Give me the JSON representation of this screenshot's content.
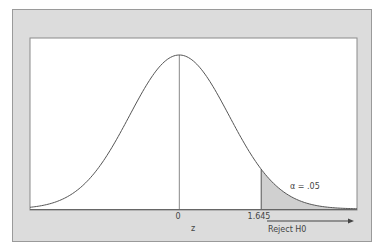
{
  "chart_data": {
    "type": "area",
    "title": "",
    "xlabel": "z",
    "ylabel": "",
    "distribution": "standard normal",
    "xlim": [
      -3.0,
      3.57
    ],
    "x_ticks": [
      {
        "value": 0,
        "label": "0"
      },
      {
        "value": 1.645,
        "label": "1.645"
      }
    ],
    "critical_value": 1.645,
    "shaded_region": {
      "from": 1.645,
      "to": 3.57,
      "label": "α = .05",
      "area": 0.05
    },
    "annotations": [
      {
        "text": "α = .05",
        "x": 2.3,
        "position": "inside right tail"
      },
      {
        "text": "Reject H0",
        "type": "arrow",
        "from": 1.645,
        "to": 3.5,
        "direction": "right"
      }
    ],
    "grid": false,
    "legend": null
  },
  "labels": {
    "zero": "0",
    "z": "z",
    "critical": "1.645",
    "alpha": "α = .05",
    "reject": "Reject H0"
  },
  "colors": {
    "frame": "#dcdcdc",
    "plot_bg": "#ffffff",
    "curve": "#555555",
    "shade": "#d0d0d0",
    "text": "#444444"
  }
}
